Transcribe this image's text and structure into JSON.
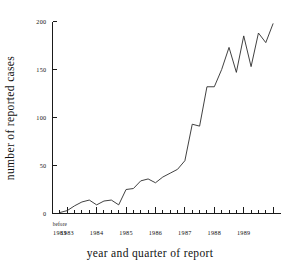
{
  "chart_data": {
    "type": "line",
    "title": "",
    "xlabel": "year and quarter of report",
    "ylabel": "number of reported cases",
    "ylim": [
      0,
      200
    ],
    "grid": false,
    "legend": null,
    "y_ticks": [
      0,
      50,
      100,
      150,
      200
    ],
    "x_tick_labels": [
      "before 1983",
      "1983",
      "1984",
      "1985",
      "1986",
      "1987",
      "1988",
      "1989"
    ],
    "x_first_label_line1": "before",
    "x_first_label_line2": "1983",
    "x_categories": [
      "before 1983",
      "1983 Q1",
      "1983 Q2",
      "1983 Q3",
      "1983 Q4",
      "1984 Q1",
      "1984 Q2",
      "1984 Q3",
      "1984 Q4",
      "1985 Q1",
      "1985 Q2",
      "1985 Q3",
      "1985 Q4",
      "1986 Q1",
      "1986 Q2",
      "1986 Q3",
      "1986 Q4",
      "1987 Q1",
      "1987 Q2",
      "1987 Q3",
      "1987 Q4",
      "1988 Q1",
      "1988 Q2",
      "1988 Q3",
      "1988 Q4"
    ],
    "values": [
      1,
      3,
      8,
      12,
      14,
      9,
      13,
      14,
      9,
      25,
      26,
      34,
      36,
      32,
      38,
      42,
      46,
      55,
      93,
      91,
      132,
      132,
      150,
      173,
      147
    ],
    "series": [
      {
        "name": "reported cases",
        "values": [
          1,
          3,
          8,
          12,
          14,
          9,
          13,
          14,
          9,
          25,
          26,
          34,
          36,
          32,
          38,
          42,
          46,
          55,
          93,
          91,
          132,
          132,
          150,
          173,
          147
        ]
      }
    ],
    "values_tail": [
      185,
      153,
      188,
      178,
      198
    ],
    "full_values": [
      1,
      3,
      8,
      12,
      14,
      9,
      13,
      14,
      9,
      25,
      26,
      34,
      36,
      32,
      38,
      42,
      46,
      55,
      93,
      91,
      132,
      132,
      150,
      173,
      147,
      185,
      153,
      188,
      178,
      198
    ],
    "line_color": "#2b2b2b",
    "axis_color": "#1a1a1a",
    "background_color": "#ffffff"
  }
}
